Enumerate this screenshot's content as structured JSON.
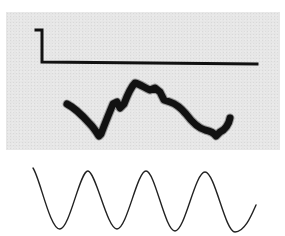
{
  "figure": {
    "panel_color": "#e6e6e6",
    "ink_color": "#111111",
    "traces": [
      {
        "name": "step-stimulus",
        "description": "Short high segment then step down to a long flat baseline",
        "path": "M 36 30 L 42 30 L 42 62 L 257 64"
      },
      {
        "name": "noisy-response",
        "description": "Thick irregular response trace",
        "path": "M 67 104 C 75 108 82 115 90 124 C 94 128 97 133 99 136 L 101 134 C 104 126 108 116 113 104 L 117 102 L 120 108 L 124 104 C 127 96 130 88 135 83 C 140 84 145 88 150 90 L 155 88 L 160 92 L 164 100 L 170 102 C 176 104 181 108 186 114 C 192 122 198 128 205 130 C 210 131 214 133 216 136 L 220 132 C 225 130 229 124 230 118"
      },
      {
        "name": "sine-reference",
        "description": "Reference sinusoid with four periods",
        "path": "M 33 168 C 40 178 50 230 60 229 C 70 228 80 170 88 171 C 96 172 107 229 117 229 C 127 229 137 171 146 171 C 155 171 165 231 175 231 C 185 231 195 172 205 172 C 215 172 225 232 235 232 C 245 232 252 214 256 205"
      }
    ]
  }
}
